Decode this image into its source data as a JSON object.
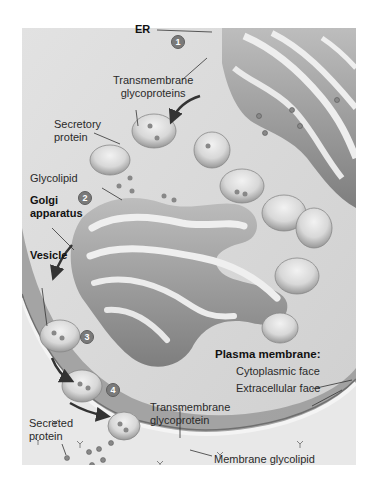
{
  "diagram": {
    "type": "biological-illustration",
    "colors": {
      "background": "#ffffff",
      "cytoplasm_light": "#d9d9d9",
      "cytoplasm_dark": "#8e8e8e",
      "extracellular": "#e6e6e6",
      "organelle_fill": "#a9a9a9",
      "organelle_lumen": "#ececec",
      "badge": "#7a7a7a",
      "arrow": "#333333"
    },
    "labels": {
      "er": "ER",
      "transmembrane_glycoproteins": [
        "Transmembrane",
        "glycoproteins"
      ],
      "secretory_protein": [
        "Secretory",
        "protein"
      ],
      "glycolipid": "Glycolipid",
      "golgi_apparatus": [
        "Golgi",
        "apparatus"
      ],
      "vesicle": "Vesicle",
      "plasma_membrane": "Plasma membrane:",
      "cytoplasmic_face": "Cytoplasmic face",
      "extracellular_face": "Extracellular face",
      "transmembrane_glycoprotein": [
        "Transmembrane",
        "glycoprotein"
      ],
      "secreted_protein": [
        "Secreted",
        "protein"
      ],
      "membrane_glycolipid": "Membrane glycolipid"
    },
    "steps": [
      {
        "number": "1"
      },
      {
        "number": "2"
      },
      {
        "number": "3"
      },
      {
        "number": "4"
      }
    ]
  }
}
